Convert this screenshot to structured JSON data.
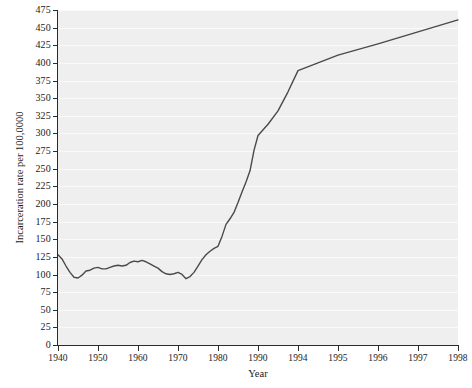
{
  "chart_data": {
    "type": "line",
    "title": "",
    "xlabel": "Year",
    "ylabel": "Incarceration rate per 100,0000",
    "ylim": [
      0,
      475
    ],
    "grid": true,
    "legend": "none",
    "y_ticks": [
      0,
      25,
      50,
      75,
      100,
      125,
      150,
      175,
      200,
      225,
      250,
      275,
      300,
      325,
      350,
      375,
      400,
      425,
      450,
      475
    ],
    "x_tick_labels": [
      "1940",
      "1950",
      "1960",
      "1970",
      "1980",
      "1990",
      "1994",
      "1995",
      "1996",
      "1997",
      "1998"
    ],
    "x_tick_positions": [
      1940,
      1950,
      1960,
      1970,
      1980,
      1990,
      1994,
      1995,
      1996,
      1997,
      1998
    ],
    "series": [
      {
        "name": "Incarceration rate",
        "color": "#4a4a4a",
        "x": [
          1940,
          1941,
          1942,
          1943,
          1944,
          1945,
          1946,
          1947,
          1948,
          1949,
          1950,
          1951,
          1952,
          1953,
          1954,
          1955,
          1956,
          1957,
          1958,
          1959,
          1960,
          1961,
          1962,
          1963,
          1964,
          1965,
          1966,
          1967,
          1968,
          1969,
          1970,
          1971,
          1972,
          1973,
          1974,
          1975,
          1976,
          1977,
          1978,
          1979,
          1980,
          1981,
          1982,
          1983,
          1984,
          1985,
          1986,
          1987,
          1988,
          1989,
          1990,
          1991,
          1992,
          1993,
          1994,
          1995,
          1996,
          1997,
          1998
        ],
        "values": [
          128,
          122,
          112,
          103,
          96,
          95,
          99,
          105,
          106,
          109,
          110,
          108,
          108,
          110,
          112,
          113,
          112,
          113,
          117,
          119,
          118,
          120,
          118,
          115,
          112,
          109,
          104,
          101,
          100,
          101,
          103,
          100,
          94,
          97,
          103,
          112,
          121,
          128,
          133,
          137,
          140,
          154,
          171,
          179,
          188,
          202,
          217,
          231,
          247,
          276,
          297,
          313,
          332,
          359,
          389,
          411,
          427,
          444,
          461
        ]
      }
    ]
  }
}
